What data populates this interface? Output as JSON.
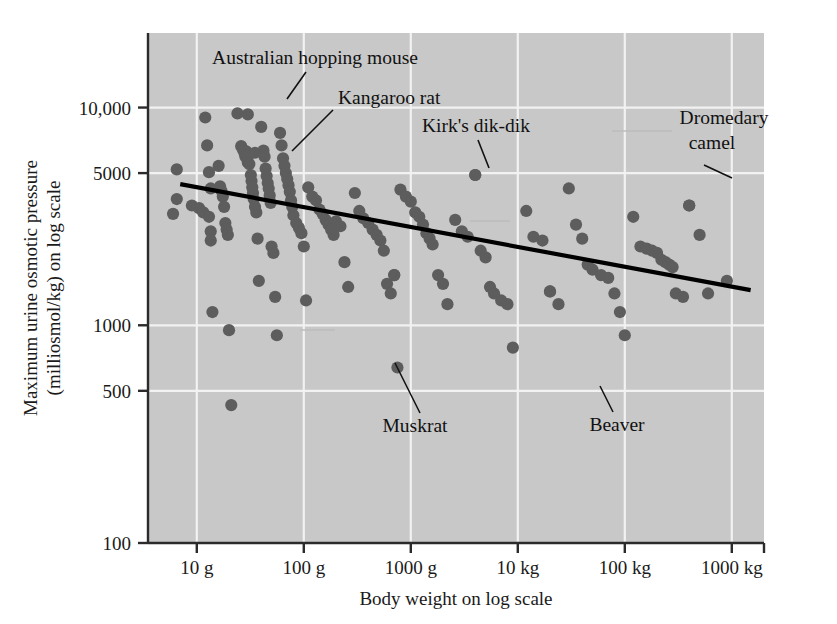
{
  "chart_data": {
    "type": "scatter",
    "title": "",
    "xlabel": "Body weight on log scale",
    "ylabel": "Maximum urine osmotic pressure (milliosmol/kg) on log scale",
    "ylabel_line1": "Maximum urine osmotic pressure",
    "ylabel_line2": "(milliosmol/kg) on log scale",
    "grid": true,
    "legend": "none",
    "x_scale": "log",
    "y_scale": "log",
    "x_tick_labels": [
      "10 g",
      "100 g",
      "1000 g",
      "10 kg",
      "100 kg",
      "1000 kg"
    ],
    "x_tick_values": [
      10,
      100,
      1000,
      10000,
      100000,
      1000000
    ],
    "x_unit": "grams",
    "xlim": [
      3.5,
      2000000
    ],
    "y_tick_labels": [
      "10,000",
      "5000",
      "1000",
      "500",
      "100"
    ],
    "y_tick_values": [
      10000,
      5000,
      1000,
      500,
      100
    ],
    "ylim": [
      100,
      22000
    ],
    "point_color": "#5d5d5d",
    "plot_background": "#c8c8c8",
    "gridline_color": "#f2f2f2",
    "regression_color": "#000000",
    "regression_line": {
      "label": "fitted trend line",
      "x_start": 7,
      "y_start": 4450,
      "x_end": 1500000,
      "y_end": 1450
    },
    "annotations": [
      {
        "label": "Australian hopping mouse",
        "x": 30,
        "y": 9300
      },
      {
        "label": "Kangaroo rat",
        "x": 35,
        "y": 6200
      },
      {
        "label": "Kirk's dik-dik",
        "x": 4000,
        "y": 4900
      },
      {
        "label": "Dromedary camel",
        "x": 400000,
        "y": 3550
      },
      {
        "label": "Muskrat",
        "x": 700,
        "y": 1700
      },
      {
        "label": "Beaver",
        "x": 20000,
        "y": 1430
      }
    ],
    "points": [
      {
        "x": 6.5,
        "y": 5200
      },
      {
        "x": 6.5,
        "y": 3800
      },
      {
        "x": 6.0,
        "y": 3250
      },
      {
        "x": 9.0,
        "y": 3550
      },
      {
        "x": 10.5,
        "y": 3450
      },
      {
        "x": 11.5,
        "y": 3300
      },
      {
        "x": 12.0,
        "y": 9000
      },
      {
        "x": 12.5,
        "y": 6700
      },
      {
        "x": 13.0,
        "y": 5050
      },
      {
        "x": 13.5,
        "y": 4250
      },
      {
        "x": 13.0,
        "y": 3150
      },
      {
        "x": 13.5,
        "y": 2700
      },
      {
        "x": 13.5,
        "y": 2450
      },
      {
        "x": 14.0,
        "y": 1150
      },
      {
        "x": 16.0,
        "y": 5400
      },
      {
        "x": 16.5,
        "y": 4350
      },
      {
        "x": 17.0,
        "y": 4150
      },
      {
        "x": 17.5,
        "y": 3900
      },
      {
        "x": 18.0,
        "y": 3500
      },
      {
        "x": 18.5,
        "y": 2950
      },
      {
        "x": 19.0,
        "y": 2750
      },
      {
        "x": 19.5,
        "y": 2600
      },
      {
        "x": 20.0,
        "y": 950
      },
      {
        "x": 21.0,
        "y": 430
      },
      {
        "x": 24.0,
        "y": 9400
      },
      {
        "x": 26.0,
        "y": 6650
      },
      {
        "x": 27.0,
        "y": 6400
      },
      {
        "x": 28.0,
        "y": 6150
      },
      {
        "x": 28.5,
        "y": 5950
      },
      {
        "x": 29.0,
        "y": 6300
      },
      {
        "x": 29.5,
        "y": 5850
      },
      {
        "x": 30.0,
        "y": 5600
      },
      {
        "x": 30.5,
        "y": 6050
      },
      {
        "x": 31.0,
        "y": 5500
      },
      {
        "x": 32.0,
        "y": 4900
      },
      {
        "x": 32.5,
        "y": 4600
      },
      {
        "x": 33.0,
        "y": 4300
      },
      {
        "x": 33.5,
        "y": 4050
      },
      {
        "x": 34.0,
        "y": 3800
      },
      {
        "x": 35.0,
        "y": 3500
      },
      {
        "x": 36.0,
        "y": 3300
      },
      {
        "x": 37.0,
        "y": 2500
      },
      {
        "x": 38.0,
        "y": 1600
      },
      {
        "x": 40.0,
        "y": 8150
      },
      {
        "x": 42.0,
        "y": 6350
      },
      {
        "x": 43.0,
        "y": 5950
      },
      {
        "x": 44.0,
        "y": 5250
      },
      {
        "x": 45.0,
        "y": 4850
      },
      {
        "x": 46.0,
        "y": 4500
      },
      {
        "x": 47.0,
        "y": 4250
      },
      {
        "x": 48.0,
        "y": 3950
      },
      {
        "x": 49.0,
        "y": 3650
      },
      {
        "x": 50.0,
        "y": 2300
      },
      {
        "x": 52.0,
        "y": 2150
      },
      {
        "x": 54.0,
        "y": 1350
      },
      {
        "x": 56.0,
        "y": 900
      },
      {
        "x": 60.0,
        "y": 7650
      },
      {
        "x": 62.0,
        "y": 6700
      },
      {
        "x": 64.0,
        "y": 5850
      },
      {
        "x": 66.0,
        "y": 5400
      },
      {
        "x": 68.0,
        "y": 5000
      },
      {
        "x": 70.0,
        "y": 4700
      },
      {
        "x": 72.0,
        "y": 4400
      },
      {
        "x": 74.0,
        "y": 4100
      },
      {
        "x": 76.0,
        "y": 3750
      },
      {
        "x": 78.0,
        "y": 3500
      },
      {
        "x": 80.0,
        "y": 3200
      },
      {
        "x": 85.0,
        "y": 2950
      },
      {
        "x": 90.0,
        "y": 2800
      },
      {
        "x": 95.0,
        "y": 2650
      },
      {
        "x": 100.0,
        "y": 2300
      },
      {
        "x": 105.0,
        "y": 1300
      },
      {
        "x": 110.0,
        "y": 4300
      },
      {
        "x": 120.0,
        "y": 3900
      },
      {
        "x": 130.0,
        "y": 3750
      },
      {
        "x": 140.0,
        "y": 3400
      },
      {
        "x": 150.0,
        "y": 3250
      },
      {
        "x": 160.0,
        "y": 3050
      },
      {
        "x": 170.0,
        "y": 2900
      },
      {
        "x": 180.0,
        "y": 2750
      },
      {
        "x": 190.0,
        "y": 2600
      },
      {
        "x": 200.0,
        "y": 3000
      },
      {
        "x": 220.0,
        "y": 2850
      },
      {
        "x": 240.0,
        "y": 1950
      },
      {
        "x": 260.0,
        "y": 1500
      },
      {
        "x": 300.0,
        "y": 4050
      },
      {
        "x": 330.0,
        "y": 3350
      },
      {
        "x": 360.0,
        "y": 3100
      },
      {
        "x": 400.0,
        "y": 2950
      },
      {
        "x": 440.0,
        "y": 2750
      },
      {
        "x": 480.0,
        "y": 2600
      },
      {
        "x": 520.0,
        "y": 2450
      },
      {
        "x": 560.0,
        "y": 2200
      },
      {
        "x": 600.0,
        "y": 1550
      },
      {
        "x": 650.0,
        "y": 1400
      },
      {
        "x": 700.0,
        "y": 1700
      },
      {
        "x": 750.0,
        "y": 640
      },
      {
        "x": 800.0,
        "y": 4200
      },
      {
        "x": 900.0,
        "y": 3900
      },
      {
        "x": 1000.0,
        "y": 3700
      },
      {
        "x": 1100.0,
        "y": 3300
      },
      {
        "x": 1200.0,
        "y": 3150
      },
      {
        "x": 1300.0,
        "y": 2900
      },
      {
        "x": 1400.0,
        "y": 2650
      },
      {
        "x": 1500.0,
        "y": 2500
      },
      {
        "x": 1600.0,
        "y": 2350
      },
      {
        "x": 1800.0,
        "y": 1700
      },
      {
        "x": 2000.0,
        "y": 1550
      },
      {
        "x": 2200.0,
        "y": 1250
      },
      {
        "x": 2600.0,
        "y": 3050
      },
      {
        "x": 3000.0,
        "y": 2700
      },
      {
        "x": 3400.0,
        "y": 2550
      },
      {
        "x": 4000.0,
        "y": 4900
      },
      {
        "x": 4500.0,
        "y": 2200
      },
      {
        "x": 5000.0,
        "y": 2050
      },
      {
        "x": 5500.0,
        "y": 1500
      },
      {
        "x": 6000.0,
        "y": 1400
      },
      {
        "x": 7000.0,
        "y": 1300
      },
      {
        "x": 8000.0,
        "y": 1250
      },
      {
        "x": 9000.0,
        "y": 790
      },
      {
        "x": 12000.0,
        "y": 3350
      },
      {
        "x": 14000.0,
        "y": 2550
      },
      {
        "x": 17000.0,
        "y": 2450
      },
      {
        "x": 20000.0,
        "y": 1430
      },
      {
        "x": 24000.0,
        "y": 1250
      },
      {
        "x": 30000.0,
        "y": 4250
      },
      {
        "x": 35000.0,
        "y": 2900
      },
      {
        "x": 40000.0,
        "y": 2500
      },
      {
        "x": 45000.0,
        "y": 1900
      },
      {
        "x": 50000.0,
        "y": 1800
      },
      {
        "x": 60000.0,
        "y": 1700
      },
      {
        "x": 70000.0,
        "y": 1650
      },
      {
        "x": 80000.0,
        "y": 1400
      },
      {
        "x": 90000.0,
        "y": 1150
      },
      {
        "x": 100000.0,
        "y": 900
      },
      {
        "x": 120000.0,
        "y": 3150
      },
      {
        "x": 140000.0,
        "y": 2300
      },
      {
        "x": 160000.0,
        "y": 2250
      },
      {
        "x": 180000.0,
        "y": 2200
      },
      {
        "x": 200000.0,
        "y": 2150
      },
      {
        "x": 220000.0,
        "y": 2000
      },
      {
        "x": 240000.0,
        "y": 1950
      },
      {
        "x": 260000.0,
        "y": 1900
      },
      {
        "x": 280000.0,
        "y": 1850
      },
      {
        "x": 300000.0,
        "y": 1400
      },
      {
        "x": 350000.0,
        "y": 1350
      },
      {
        "x": 400000.0,
        "y": 3550
      },
      {
        "x": 500000.0,
        "y": 2600
      },
      {
        "x": 600000.0,
        "y": 1400
      },
      {
        "x": 900000.0,
        "y": 1600
      }
    ]
  }
}
